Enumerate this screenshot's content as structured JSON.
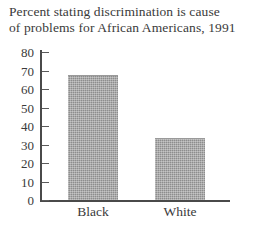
{
  "chart_data": {
    "type": "bar",
    "title": "Percent stating discrimination is cause\nof problems for African Americans, 1991",
    "xlabel": "",
    "ylabel": "",
    "categories": [
      "Black",
      "White"
    ],
    "values": [
      67,
      33
    ],
    "ylim": [
      0,
      80
    ],
    "yticks": [
      0,
      10,
      20,
      30,
      40,
      50,
      60,
      70,
      80
    ],
    "ytick_labels": [
      "0",
      "10",
      "20",
      "30",
      "40",
      "50",
      "60",
      "70",
      "80"
    ],
    "grid": false,
    "legend": null,
    "bar_color": "#8d8d8d",
    "axis_color": "#4a4a4a",
    "background": "#ffffff"
  }
}
